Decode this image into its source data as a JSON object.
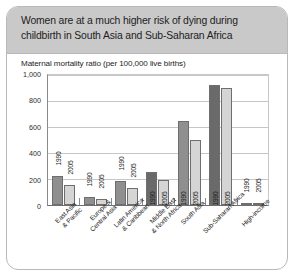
{
  "card": {
    "title": "Women are at a much higher risk of dying during childbirth in South Asia and Sub-Saharan Africa",
    "source": "Source: WHO; UNICEF; UNFPA; World Bank, 2007, Maternal Mortality in 2005."
  },
  "chart_data": {
    "type": "bar",
    "title": "Women are at a much higher risk of dying during childbirth in South Asia and Sub-Saharan Africa",
    "subtitle": "Maternal mortality ratio (per 100,000 live births)",
    "xlabel": "",
    "ylabel": "",
    "ylim": [
      0,
      1000
    ],
    "yticks": [
      "0",
      "200",
      "400",
      "600",
      "800",
      "1,000"
    ],
    "grid": true,
    "legend": "none",
    "bar_labels": [
      "1990",
      "2005"
    ],
    "categories": [
      "East Asia & Pacific",
      "Europe & Central Asia",
      "Latin America & Caribbean",
      "Middle East & North Africa",
      "South Asia",
      "Sub-Saharan Africa",
      "High-income"
    ],
    "series": [
      {
        "name": "1990",
        "values": [
          220,
          60,
          180,
          250,
          640,
          910,
          12
        ]
      },
      {
        "name": "2005",
        "values": [
          150,
          45,
          130,
          190,
          490,
          885,
          8
        ]
      }
    ],
    "bars": [
      {
        "category": "East Asia & Pacific",
        "year": "1990",
        "value": 220,
        "shade": "dark",
        "label_outside": true
      },
      {
        "category": "East Asia & Pacific",
        "year": "2005",
        "value": 150,
        "shade": "light",
        "label_outside": true
      },
      {
        "category": "Europe & Central Asia",
        "year": "1990",
        "value": 60,
        "shade": "dark",
        "label_outside": true
      },
      {
        "category": "Europe & Central Asia",
        "year": "2005",
        "value": 45,
        "shade": "light",
        "label_outside": true
      },
      {
        "category": "Latin America & Caribbean",
        "year": "1990",
        "value": 180,
        "shade": "dark",
        "label_outside": true
      },
      {
        "category": "Latin America & Caribbean",
        "year": "2005",
        "value": 130,
        "shade": "light",
        "label_outside": true
      },
      {
        "category": "Middle East & North Africa",
        "year": "1990",
        "value": 250,
        "shade": "vdark",
        "label_outside": false
      },
      {
        "category": "Middle East & North Africa",
        "year": "2005",
        "value": 190,
        "shade": "light",
        "label_outside": false
      },
      {
        "category": "South Asia",
        "year": "1990",
        "value": 640,
        "shade": "dark",
        "label_outside": false
      },
      {
        "category": "South Asia",
        "year": "2005",
        "value": 490,
        "shade": "light",
        "label_outside": false
      },
      {
        "category": "Sub-Saharan Africa",
        "year": "1990",
        "value": 910,
        "shade": "vdark",
        "label_outside": false
      },
      {
        "category": "Sub-Saharan Africa",
        "year": "2005",
        "value": 885,
        "shade": "light",
        "label_outside": false
      },
      {
        "category": "High-income",
        "year": "1990",
        "value": 12,
        "shade": "vdark",
        "label_outside": true
      },
      {
        "category": "High-income",
        "year": "2005",
        "value": 8,
        "shade": "light",
        "label_outside": true
      }
    ]
  }
}
